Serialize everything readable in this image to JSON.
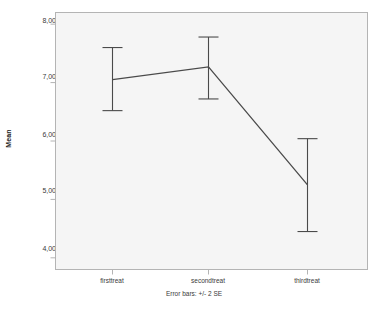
{
  "chart_data": {
    "type": "line",
    "title": "",
    "subtitle": "",
    "xlabel": "",
    "ylabel": "Mean",
    "categories": [
      "firsttreat",
      "secondtreat",
      "thirdtreat"
    ],
    "values": [
      7.05,
      7.27,
      5.25
    ],
    "error_low": [
      6.52,
      6.72,
      4.45
    ],
    "error_high": [
      7.6,
      7.78,
      6.04
    ],
    "error_type": "+/- 2 SE",
    "caption": "Error bars: +/- 2 SE",
    "ylim": [
      3.8,
      8.2
    ],
    "yticks": [
      4,
      5,
      6,
      7,
      8
    ],
    "ytick_labels": [
      "4,00",
      "5,00",
      "6,00",
      "7,00",
      "8,00"
    ],
    "grid": false,
    "legend": "none",
    "series": [
      {
        "name": "Mean",
        "values": [
          7.05,
          7.27,
          5.25
        ]
      }
    ],
    "colors": {
      "line": "#4a4a4a",
      "error_bar": "#4a4a4a",
      "plot_background": "#f5f5f5",
      "page_background": "#ffffff",
      "frame": "#b4b4b4",
      "text": "#3a3a3a"
    }
  },
  "axes": {
    "y_title": "Mean",
    "y_tick_labels": [
      "8,00",
      "7,00",
      "6,00",
      "5,00",
      "4,00"
    ],
    "x_tick_labels": [
      "firsttreat",
      "secondtreat",
      "thirdtreat"
    ]
  },
  "footer": {
    "error_note": "Error bars: +/- 2 SE"
  }
}
